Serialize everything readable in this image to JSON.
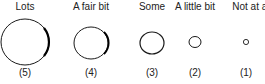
{
  "scale": {
    "items": [
      {
        "label": "Lots",
        "value": "(5)"
      },
      {
        "label": "A fair bit",
        "value": "(4)"
      },
      {
        "label": "Some",
        "value": "(3)"
      },
      {
        "label": "A little bit",
        "value": "(2)"
      },
      {
        "label": "Not at all",
        "value": "(1)"
      }
    ]
  },
  "colors": {
    "stroke": "#1a1a1a"
  }
}
